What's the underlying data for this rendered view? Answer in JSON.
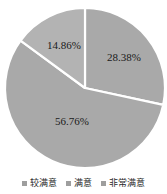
{
  "chart_data": {
    "type": "pie",
    "title": "",
    "subtitle": "",
    "xlabel": "",
    "ylabel": "",
    "legend_position": "bottom",
    "grid": false,
    "categories": [
      "较满意",
      "满意",
      "非常满意"
    ],
    "values": [
      56.76,
      14.86,
      28.38
    ],
    "labels": [
      "56.76%",
      "14.86%",
      "28.38%"
    ],
    "slices": [
      {
        "name": "非常满意",
        "value": 28.38,
        "label": "28.38%",
        "color": "#a9a9a9",
        "start_angle": 0,
        "end_angle": 102.17,
        "label_x": 124,
        "label_y": 58
      },
      {
        "name": "较满意",
        "value": 56.76,
        "label": "56.76%",
        "color": "#a9a9a9",
        "start_angle": 102.17,
        "end_angle": 306.34,
        "label_x": 72,
        "label_y": 122
      },
      {
        "name": "满意",
        "value": 14.86,
        "label": "14.86%",
        "color": "#b3b3b3",
        "start_angle": 306.34,
        "end_angle": 360,
        "label_x": 64,
        "label_y": 46
      }
    ],
    "separator_color": "#ffffff",
    "background_color": "#ffffff",
    "center_x": 85,
    "center_y": 88,
    "radius": 80
  },
  "legend": {
    "items": [
      {
        "label": "较满意",
        "color": "#9e9e9e"
      },
      {
        "label": "满意",
        "color": "#9e9e9e"
      },
      {
        "label": "非常满意",
        "color": "#9e9e9e"
      }
    ]
  }
}
